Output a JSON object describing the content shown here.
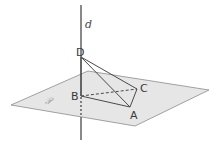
{
  "figure": {
    "type": "3D geometry: tetrahedron with line perpendicular to plane",
    "line_label": "d",
    "plane_label": "𝒫",
    "points": [
      {
        "name": "D",
        "x": 81,
        "y": 57
      },
      {
        "name": "B",
        "x": 81,
        "y": 96
      },
      {
        "name": "C",
        "x": 137,
        "y": 89
      },
      {
        "name": "A",
        "x": 130,
        "y": 107
      }
    ],
    "colors": {
      "plane_fill": "#e6e6e6",
      "plane_stroke": "#8c8c8c",
      "line_stroke": "#4a4a4a",
      "label": "#3a3a3a"
    }
  }
}
